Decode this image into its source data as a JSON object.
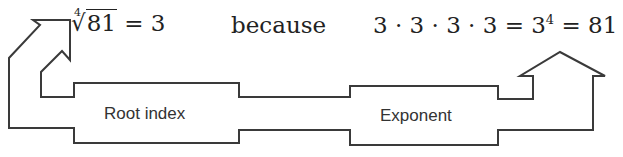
{
  "equation_left": {
    "index": "4",
    "radical_symbol": "√",
    "radicand": "81",
    "rest": " = 3"
  },
  "connector": "because",
  "equation_right": {
    "product": "3 · 3 · 3 · 3 = 3",
    "exponent": "4",
    "result": " = 81"
  },
  "labels": {
    "root_index": "Root index",
    "exponent": "Exponent"
  },
  "colors": {
    "stroke": "#3a3a3a",
    "text": "#222222"
  }
}
